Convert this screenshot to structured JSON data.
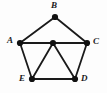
{
  "figure": {
    "background_color": "#fdfdfd",
    "edge_color": "#1a1a1a",
    "vertex_color": "#111111",
    "label_color": "#1a1a1a",
    "width": 107,
    "height": 93
  },
  "graph_data": {
    "type": "node-link-diagram",
    "directed": false,
    "vertex_count": 6,
    "edge_count": 9,
    "vertices": [
      {
        "id": "A",
        "label": "A",
        "x": 20,
        "y": 43,
        "r": 3.1,
        "label_x": 7,
        "label_y": 36,
        "labeled": true
      },
      {
        "id": "B",
        "label": "B",
        "x": 55,
        "y": 17,
        "r": 3.1,
        "label_x": 51,
        "label_y": 1,
        "labeled": true
      },
      {
        "id": "C",
        "label": "C",
        "x": 87,
        "y": 43,
        "r": 3.1,
        "label_x": 93,
        "label_y": 37,
        "labeled": true
      },
      {
        "id": "D",
        "label": "D",
        "x": 75,
        "y": 79,
        "r": 3.1,
        "label_x": 81,
        "label_y": 74,
        "labeled": true
      },
      {
        "id": "E",
        "label": "E",
        "x": 32,
        "y": 79,
        "r": 3.1,
        "label_x": 19,
        "label_y": 74,
        "labeled": true
      },
      {
        "id": "F",
        "label": "",
        "x": 53,
        "y": 43,
        "r": 3.1,
        "label_x": 0,
        "label_y": 0,
        "labeled": false
      }
    ],
    "edges": [
      {
        "from": "A",
        "to": "B"
      },
      {
        "from": "B",
        "to": "C"
      },
      {
        "from": "A",
        "to": "F"
      },
      {
        "from": "F",
        "to": "C"
      },
      {
        "from": "A",
        "to": "E"
      },
      {
        "from": "C",
        "to": "D"
      },
      {
        "from": "E",
        "to": "F"
      },
      {
        "from": "F",
        "to": "D"
      },
      {
        "from": "E",
        "to": "D"
      }
    ]
  }
}
